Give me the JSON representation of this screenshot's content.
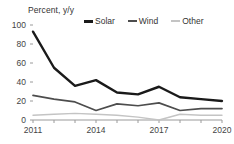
{
  "chart_data": {
    "type": "line",
    "title": "Percent, y/y",
    "xlabel": "",
    "ylabel": "Percent, y/y",
    "x": [
      2011,
      2012,
      2013,
      2014,
      2015,
      2016,
      2017,
      2018,
      2019,
      2020
    ],
    "categories": [
      "2011",
      "2012",
      "2013",
      "2014",
      "2015",
      "2016",
      "2017",
      "2018",
      "2019",
      "2020"
    ],
    "xtick_labels": [
      "2011",
      "2014",
      "2017",
      "2020"
    ],
    "ytick_labels": [
      "0",
      "20",
      "40",
      "60",
      "80",
      "100"
    ],
    "yticks": [
      0,
      20,
      40,
      60,
      80,
      100
    ],
    "ylim": [
      0,
      100
    ],
    "xlim": [
      2011,
      2020
    ],
    "grid": false,
    "legend_position": "top",
    "series": [
      {
        "name": "Solar",
        "color": "#1a1a1a",
        "values": [
          93,
          55,
          36,
          42,
          29,
          27,
          35,
          24,
          22,
          20
        ]
      },
      {
        "name": "Wind",
        "color": "#4d4d4d",
        "values": [
          26,
          22,
          19,
          10,
          17,
          15,
          18,
          10,
          12,
          12
        ]
      },
      {
        "name": "Other",
        "color": "#c4c4c4",
        "values": [
          5,
          6,
          7,
          6,
          5,
          3,
          0,
          6,
          5,
          5
        ]
      }
    ]
  },
  "axis_title": "Percent, y/y",
  "legend": {
    "items": [
      {
        "label": "Solar"
      },
      {
        "label": "Wind"
      },
      {
        "label": "Other"
      }
    ]
  }
}
